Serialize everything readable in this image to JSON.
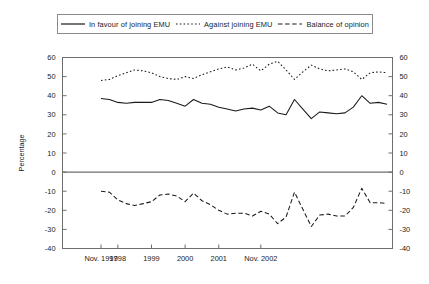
{
  "legend": {
    "items": [
      {
        "label": "In favour of joining EMU",
        "style": "solid",
        "swatch": "line-solid-icon"
      },
      {
        "label": "Against joining EMU",
        "style": "dotted",
        "swatch": "line-dotted-icon"
      },
      {
        "label": "Balance of opinion",
        "style": "dashed",
        "swatch": "line-dashed-icon"
      }
    ]
  },
  "chart_data": {
    "type": "line",
    "title": "",
    "xlabel": "",
    "ylabel": "Percentage",
    "ylim": [
      -40,
      60
    ],
    "yticks": [
      60,
      50,
      40,
      30,
      20,
      10,
      0,
      -10,
      -20,
      -30,
      -40
    ],
    "ytick_labels": [
      "60",
      "50",
      "40",
      "30",
      "20",
      "10",
      "0",
      "-10",
      "-20",
      "-30",
      "-40"
    ],
    "right_axis": true,
    "grid": false,
    "legend_position": "top",
    "x_tick_labels": [
      "Nov. 1997",
      "1998",
      "1999",
      "2000",
      "2001",
      "Nov. 2002"
    ],
    "x_tick_positions": [
      0,
      2,
      6,
      10,
      14,
      19
    ],
    "x": [
      0,
      1,
      2,
      3,
      4,
      5,
      6,
      7,
      8,
      9,
      10,
      11,
      12,
      13,
      14,
      15,
      16,
      17,
      18,
      19,
      20,
      21,
      22,
      23,
      24,
      25,
      26,
      27,
      28,
      29,
      30,
      31,
      32,
      33,
      34
    ],
    "xlim": [
      0,
      34
    ],
    "series": [
      {
        "name": "In favour of joining EMU",
        "style": "solid",
        "values": [
          38.5,
          38.0,
          36.5,
          36.0,
          36.5,
          36.5,
          36.5,
          38.0,
          37.5,
          36.0,
          34.5,
          38.0,
          36.0,
          35.5,
          34.0,
          33.0,
          32.0,
          33.0,
          33.5,
          32.5,
          34.5,
          31.0,
          30.0,
          38.0,
          33.0,
          28.0,
          31.5,
          31.0,
          30.5,
          31.0,
          34.0,
          40.0,
          36.0,
          36.5,
          35.5
        ]
      },
      {
        "name": "Against joining EMU",
        "style": "dotted",
        "values": [
          48.0,
          48.5,
          50.5,
          52.0,
          53.5,
          53.0,
          52.0,
          50.0,
          49.0,
          48.5,
          50.0,
          49.0,
          51.0,
          52.5,
          54.0,
          55.0,
          53.5,
          54.5,
          56.5,
          53.0,
          56.5,
          58.0,
          53.5,
          48.5,
          52.5,
          56.0,
          54.0,
          53.0,
          53.5,
          54.0,
          52.5,
          48.5,
          52.0,
          52.5,
          52.0
        ]
      },
      {
        "name": "Balance of opinion",
        "style": "dashed",
        "values": [
          -10.0,
          -10.5,
          -14.5,
          -16.5,
          -17.5,
          -16.5,
          -15.5,
          -12.0,
          -11.5,
          -12.5,
          -15.5,
          -11.0,
          -15.0,
          -17.0,
          -20.0,
          -22.0,
          -21.5,
          -21.5,
          -23.0,
          -20.5,
          -22.0,
          -27.0,
          -23.5,
          -10.5,
          -19.5,
          -28.5,
          -22.5,
          -22.0,
          -23.0,
          -23.0,
          -18.5,
          -8.5,
          -16.0,
          -16.0,
          -16.5
        ]
      }
    ]
  }
}
